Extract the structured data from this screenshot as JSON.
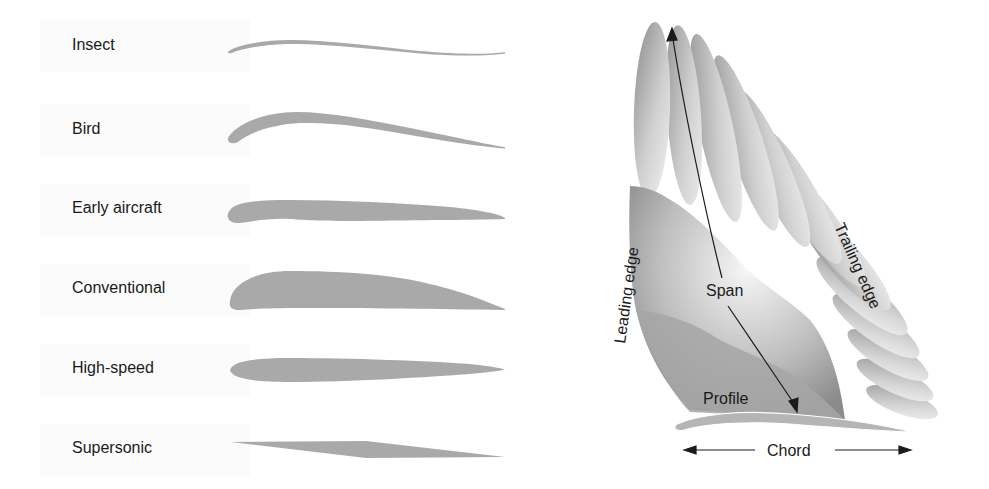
{
  "profiles": {
    "title_hidden": "",
    "items": [
      {
        "label": "Insect",
        "shape": "thin-cambered-plate"
      },
      {
        "label": "Bird",
        "shape": "cambered-thick-leading-edge"
      },
      {
        "label": "Early aircraft",
        "shape": "flat-bottom-thin"
      },
      {
        "label": "Conventional",
        "shape": "thick-cambered"
      },
      {
        "label": "High-speed",
        "shape": "symmetric-thin"
      },
      {
        "label": "Supersonic",
        "shape": "double-wedge"
      }
    ],
    "fill_color": "#a9a9a9"
  },
  "wing": {
    "labels": {
      "leading_edge": "Leading edge",
      "trailing_edge": "Trailing edge",
      "span": "Span",
      "profile": "Profile",
      "chord": "Chord"
    },
    "colors": {
      "feather_dark": "#8e8e8e",
      "feather_light": "#f2f2f2",
      "arrow": "#1a1a1a"
    }
  }
}
